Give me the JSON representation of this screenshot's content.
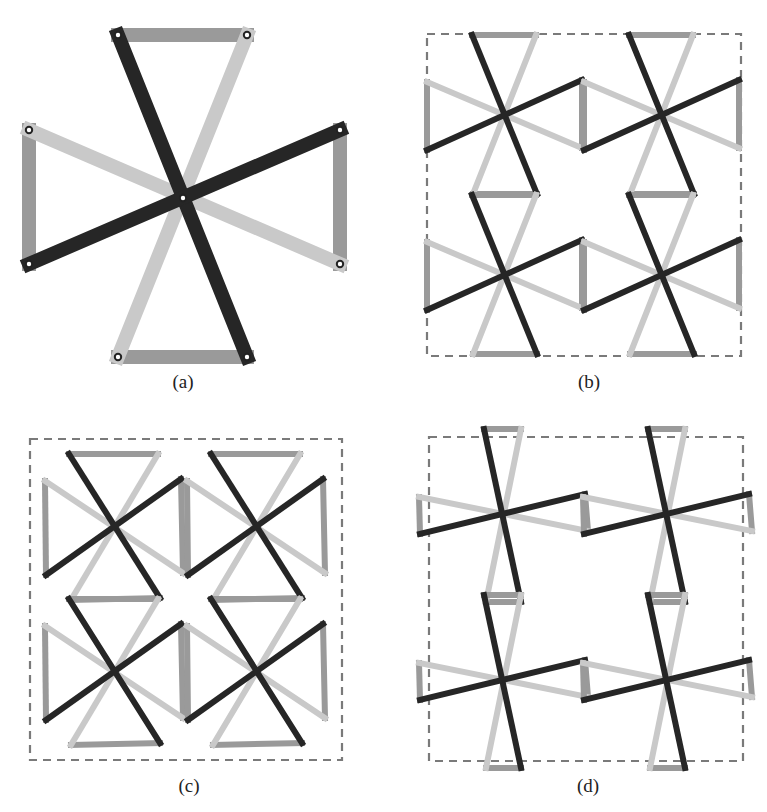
{
  "colors": {
    "dark": "#262626",
    "light": "#c9c9c9",
    "link": "#9a9a9a",
    "dash": "#7a7a7a",
    "pivot_fill": "#ffffff",
    "pivot_stroke": "#222222"
  },
  "panels": [
    {
      "id": "a",
      "label": "(a)",
      "label_pos": [
        183,
        372
      ],
      "bar_width": 14,
      "show_pivots": true,
      "box": null,
      "offsets": {
        "TL": [
          -65,
          -163
        ],
        "TR": [
          64,
          -163
        ],
        "LT": [
          -154,
          -68
        ],
        "LB": [
          -154,
          66
        ],
        "RT": [
          157,
          -68
        ],
        "RB": [
          157,
          66
        ],
        "BL": [
          -65,
          159
        ],
        "BR": [
          64,
          159
        ]
      },
      "centers": [
        [
          183,
          198
        ]
      ]
    },
    {
      "id": "b",
      "label": "(b)",
      "label_pos": [
        589,
        372
      ],
      "bar_width": 6,
      "show_pivots": false,
      "box": [
        427,
        34,
        741,
        356
      ],
      "offsets": {
        "TL": [
          -33,
          -79
        ],
        "TR": [
          31,
          -79
        ],
        "LT": [
          -78,
          -32
        ],
        "LB": [
          -78,
          36
        ],
        "RT": [
          77,
          -34
        ],
        "RB": [
          77,
          34
        ],
        "BL": [
          -32,
          80
        ],
        "BR": [
          32,
          80
        ]
      },
      "centers": [
        [
          505,
          114
        ],
        [
          662,
          114
        ],
        [
          505,
          274
        ],
        [
          662,
          274
        ]
      ]
    },
    {
      "id": "c",
      "label": "(c)",
      "label_pos": [
        189,
        776
      ],
      "bar_width": 6,
      "show_pivots": false,
      "box": [
        30,
        439,
        342,
        760
      ],
      "offsets": {
        "TL": [
          -45,
          -74
        ],
        "TR": [
          44,
          -74
        ],
        "LT": [
          -69,
          -47
        ],
        "LB": [
          -68,
          47
        ],
        "RT": [
          67,
          -49
        ],
        "RB": [
          69,
          45
        ],
        "BL": [
          -43,
          72
        ],
        "BR": [
          46,
          70
        ]
      },
      "centers": [
        [
          114,
          528
        ],
        [
          256,
          528
        ],
        [
          114,
          673
        ],
        [
          256,
          673
        ]
      ]
    },
    {
      "id": "d",
      "label": "(d)",
      "label_pos": [
        588,
        776
      ],
      "bar_width": 6,
      "show_pivots": false,
      "box": [
        429,
        437,
        743,
        761
      ],
      "offsets": {
        "TL": [
          -18,
          -87
        ],
        "TR": [
          19,
          -87
        ],
        "LT": [
          -83,
          -19
        ],
        "LB": [
          -82,
          18
        ],
        "RT": [
          83,
          -22
        ],
        "RB": [
          86,
          15
        ],
        "BL": [
          -16,
          86
        ],
        "BR": [
          19,
          86
        ]
      },
      "centers": [
        [
          502,
          516
        ],
        [
          666,
          516
        ],
        [
          502,
          682
        ],
        [
          666,
          682
        ]
      ]
    }
  ],
  "figure_caption_labels": [
    "(a)",
    "(b)",
    "(c)",
    "(d)"
  ]
}
